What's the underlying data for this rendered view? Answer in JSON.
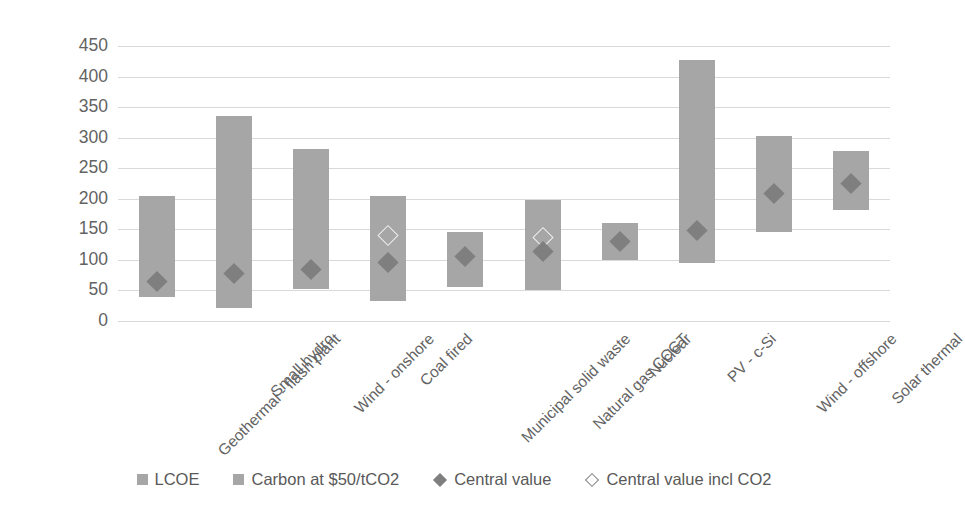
{
  "chart_data": {
    "type": "bar",
    "title": "",
    "subtitle": "",
    "xlabel": "",
    "ylabel": "",
    "ylim": [
      0,
      450
    ],
    "ytick_step": 50,
    "yticks": [
      450,
      400,
      350,
      300,
      250,
      200,
      150,
      100,
      50,
      0
    ],
    "grid": true,
    "legend_position": "bottom",
    "categories": [
      "Geothermal - flash plant",
      "Small hydro",
      "Wind - onshore",
      "Coal fired",
      "Municipal solid waste",
      "Natural gas CCGT",
      "Nuclear",
      "PV - c-Si",
      "Wind - offshore",
      "Solar thermal"
    ],
    "series": [
      {
        "name": "LCOE",
        "type": "range-bar",
        "color": "#a6a6a6",
        "low": [
          40,
          22,
          52,
          33,
          55,
          50,
          100,
          95,
          145,
          182
        ],
        "high": [
          205,
          335,
          282,
          205,
          145,
          198,
          160,
          427,
          303,
          278
        ]
      },
      {
        "name": "Carbon at $50/tCO2",
        "type": "range-bar",
        "color": "#a6a6a6",
        "low": [
          null,
          null,
          null,
          null,
          null,
          null,
          null,
          null,
          null,
          null
        ],
        "high": [
          null,
          null,
          null,
          null,
          null,
          null,
          null,
          null,
          null,
          null
        ]
      },
      {
        "name": "Central value",
        "type": "marker",
        "marker": "filled-diamond",
        "color": "#7f7f7f",
        "values": [
          65,
          78,
          85,
          95,
          105,
          113,
          130,
          148,
          208,
          225
        ]
      },
      {
        "name": "Central value incl CO2",
        "type": "marker",
        "marker": "hollow-diamond",
        "color": "#ffffff",
        "values": [
          null,
          null,
          null,
          140,
          null,
          136,
          null,
          null,
          null,
          null
        ]
      }
    ]
  },
  "legend": {
    "items": [
      {
        "label": "LCOE",
        "glyph": "square-swatch-icon",
        "style": "square"
      },
      {
        "label": "Carbon at $50/tCO2",
        "glyph": "square-swatch-icon",
        "style": "square-carbon"
      },
      {
        "label": "Central value",
        "glyph": "filled-diamond-icon",
        "style": "diamond-filled"
      },
      {
        "label": "Central value incl CO2",
        "glyph": "hollow-diamond-icon",
        "style": "diamond-hollow"
      }
    ]
  },
  "colors": {
    "bar": "#a6a6a6",
    "marker_filled": "#7f7f7f",
    "marker_hollow": "#ffffff",
    "gridline": "#d9d9d9",
    "text": "#595959",
    "background": "#ffffff"
  }
}
